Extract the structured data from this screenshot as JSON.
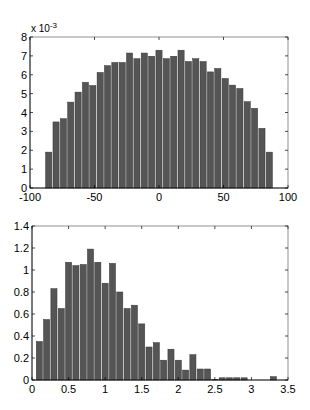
{
  "chart_data": [
    {
      "type": "bar",
      "title": "",
      "xlabel": "",
      "ylabel": "",
      "y_multiplier_label": "x 10^-3",
      "xlim": [
        -100,
        100
      ],
      "ylim": [
        0,
        8
      ],
      "grid": false,
      "x_ticks": [
        -100,
        -50,
        0,
        50,
        100
      ],
      "y_ticks": [
        0,
        1,
        2,
        3,
        4,
        5,
        6,
        7,
        8
      ],
      "bin_width": 5.7,
      "x": [
        -85.5,
        -79.8,
        -74.1,
        -68.4,
        -62.7,
        -57.0,
        -51.3,
        -45.6,
        -39.9,
        -34.2,
        -28.5,
        -22.8,
        -17.1,
        -11.4,
        -5.7,
        0.0,
        5.7,
        11.4,
        17.1,
        22.8,
        28.5,
        34.2,
        39.9,
        45.6,
        51.3,
        57.0,
        62.7,
        68.4,
        74.1,
        79.8,
        85.5
      ],
      "values": [
        1.9,
        3.5,
        3.67,
        4.55,
        5.08,
        5.6,
        5.43,
        6.12,
        6.48,
        6.65,
        6.65,
        7.15,
        6.85,
        7.15,
        6.98,
        7.3,
        6.85,
        6.98,
        7.3,
        6.7,
        6.85,
        6.7,
        6.15,
        6.33,
        5.8,
        5.45,
        5.27,
        4.57,
        4.22,
        3.16,
        1.9
      ]
    },
    {
      "type": "bar",
      "title": "",
      "xlabel": "",
      "ylabel": "",
      "xlim": [
        0,
        3.5
      ],
      "ylim": [
        0,
        1.4
      ],
      "grid": false,
      "x_ticks": [
        0,
        0.5,
        1,
        1.5,
        2,
        2.5,
        3,
        3.5
      ],
      "y_ticks": [
        0,
        0.2,
        0.4,
        0.6,
        0.8,
        1,
        1.2,
        1.4
      ],
      "bin_width": 0.1,
      "x": [
        0.1,
        0.2,
        0.3,
        0.4,
        0.5,
        0.6,
        0.7,
        0.8,
        0.9,
        1.0,
        1.1,
        1.2,
        1.3,
        1.4,
        1.5,
        1.6,
        1.7,
        1.8,
        1.9,
        2.0,
        2.1,
        2.2,
        2.3,
        2.4,
        2.5,
        2.6,
        2.7,
        2.8,
        2.9,
        3.0,
        3.1,
        3.2,
        3.3
      ],
      "values": [
        0.35,
        0.55,
        0.83,
        0.65,
        1.07,
        1.04,
        1.05,
        1.19,
        1.07,
        0.88,
        1.06,
        0.8,
        0.65,
        0.68,
        0.51,
        0.3,
        0.34,
        0.18,
        0.28,
        0.18,
        0.09,
        0.23,
        0.1,
        0.1,
        0.005,
        0.02,
        0.02,
        0.02,
        0.02,
        0.0,
        0.0,
        0.0,
        0.03
      ]
    }
  ],
  "labels": {
    "top_exp_base": "x 10",
    "top_exp_power": "-3"
  }
}
